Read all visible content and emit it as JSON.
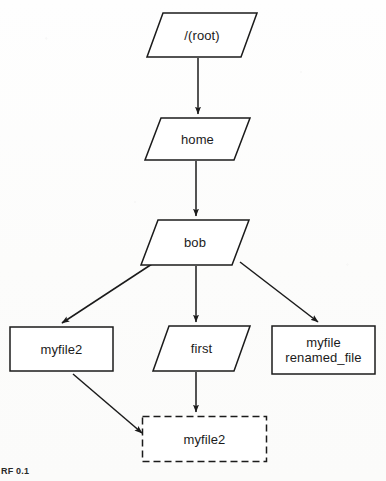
{
  "figure": {
    "caption": "RF 0.1",
    "background_color": "#fdfdfc",
    "ink_color": "#1b1b1b"
  },
  "diagram": {
    "type": "filesystem-tree",
    "nodes": [
      {
        "id": "root",
        "label": "/(root)",
        "shape": "parallelogram",
        "kind": "directory",
        "x": 146,
        "y": 12,
        "w": 112,
        "h": 46
      },
      {
        "id": "home",
        "label": "home",
        "shape": "parallelogram",
        "kind": "directory",
        "x": 144,
        "y": 117,
        "w": 107,
        "h": 44
      },
      {
        "id": "bob",
        "label": "bob",
        "shape": "parallelogram",
        "kind": "directory",
        "x": 140,
        "y": 219,
        "w": 110,
        "h": 47
      },
      {
        "id": "myfile2_left",
        "label": "myfile2",
        "shape": "rectangle",
        "kind": "file",
        "x": 9,
        "y": 326,
        "w": 105,
        "h": 46
      },
      {
        "id": "first",
        "label": "first",
        "shape": "parallelogram",
        "kind": "directory",
        "x": 152,
        "y": 325,
        "w": 99,
        "h": 47
      },
      {
        "id": "myfile",
        "label": "myfile\nrenamed_file",
        "shape": "rectangle",
        "kind": "file",
        "x": 271,
        "y": 325,
        "w": 105,
        "h": 50
      },
      {
        "id": "myfile2_link",
        "label": "myfile2",
        "shape": "rectangle-dashed",
        "kind": "link",
        "x": 141,
        "y": 415,
        "w": 127,
        "h": 48
      }
    ],
    "edges": [
      {
        "from": "root",
        "to": "home",
        "style": "straight-vertical"
      },
      {
        "from": "home",
        "to": "bob",
        "style": "straight-vertical"
      },
      {
        "from": "bob",
        "to": "myfile2_left",
        "style": "diagonal-left"
      },
      {
        "from": "bob",
        "to": "first",
        "style": "straight-vertical"
      },
      {
        "from": "bob",
        "to": "myfile",
        "style": "diagonal-right"
      },
      {
        "from": "first",
        "to": "myfile2_link",
        "style": "straight-vertical"
      },
      {
        "from": "myfile2_left",
        "to": "myfile2_link",
        "style": "diagonal-right"
      }
    ]
  }
}
